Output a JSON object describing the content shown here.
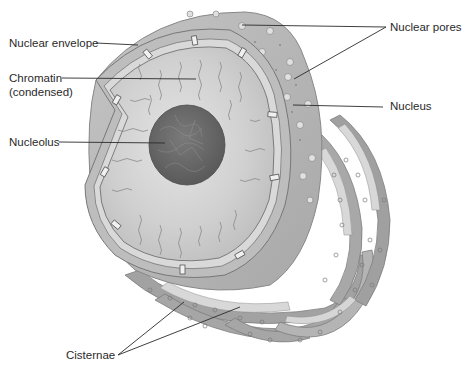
{
  "diagram": {
    "labels": {
      "nuclear_envelope": "Nuclear envelope",
      "chromatin_line1": "Chromatin",
      "chromatin_line2": "(condensed)",
      "nucleolus": "Nucleolus",
      "nuclear_pores": "Nuclear pores",
      "nucleus": "Nucleus",
      "cisternae": "Cisternae"
    },
    "colors": {
      "background": "#ffffff",
      "nucleoplasm": "#cfcfcf",
      "nucleolus": "#6e6e6e",
      "envelope": "#b5b5b5",
      "er_dark": "#9a9a9a",
      "er_light": "#d6d6d6",
      "leader_line": "#2a2a2a"
    }
  }
}
